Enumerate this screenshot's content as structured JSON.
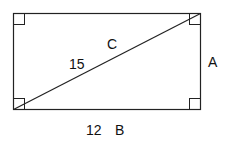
{
  "diagram": {
    "shape": "rectangle",
    "stroke_color": "#222222",
    "labels": {
      "diagonal_name": "C",
      "diagonal_value": "15",
      "side_right_name": "A",
      "side_bottom_value": "12",
      "side_bottom_name": "B"
    }
  }
}
